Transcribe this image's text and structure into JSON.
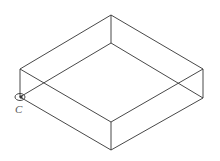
{
  "diagram": {
    "type": "isometric-box-wireframe",
    "line_color": "#333333",
    "vertices": {
      "top_back": [
        111,
        15
      ],
      "top_left": [
        20,
        69
      ],
      "top_right": [
        203,
        69
      ],
      "top_front": [
        111,
        122
      ],
      "bottom_back": [
        111,
        43
      ],
      "bottom_left": [
        20,
        97
      ],
      "bottom_right": [
        203,
        98
      ],
      "bottom_front": [
        111,
        150
      ]
    },
    "point_marker": {
      "label": "C",
      "x": 21,
      "y": 97
    }
  }
}
